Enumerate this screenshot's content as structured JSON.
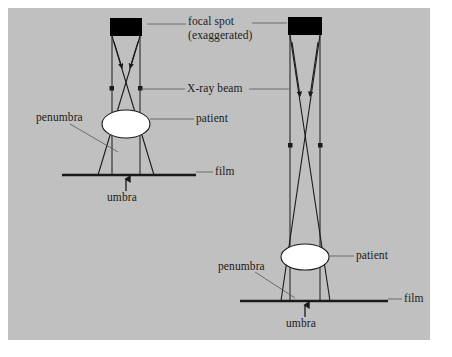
{
  "figure": {
    "background_color": "#c0c0c0",
    "border_color": "#ffffff",
    "line_color": "#1a1a1a",
    "focal_spot_color": "#000000",
    "patient_color": "#ffffff"
  },
  "labels": {
    "focal_spot": "focal spot",
    "focal_spot_note": "(exaggerated)",
    "xray_beam": "X-ray beam",
    "patient_left": "patient",
    "patient_right": "patient",
    "penumbra_left": "penumbra",
    "penumbra_right": "penumbra",
    "film_left": "film",
    "film_right": "film",
    "umbra_left": "umbra",
    "umbra_right": "umbra"
  },
  "diagrams": [
    {
      "name": "short-source-to-film-distance",
      "focal_spot": {
        "x": 110,
        "y": 18,
        "width": 32,
        "height": 18
      },
      "patient": {
        "cx": 126,
        "cy": 124,
        "rx": 24,
        "ry": 14
      },
      "film": {
        "x1": 62,
        "x2": 196,
        "y": 175
      },
      "beam_left_edge_top": 112,
      "beam_right_edge_top": 140,
      "beam_left_edge_bottom": 104,
      "beam_right_edge_bottom": 148,
      "umbra_arrow_x": 126,
      "umbra_arrow_y": 182
    },
    {
      "name": "long-source-to-film-distance",
      "focal_spot": {
        "x": 288,
        "y": 17,
        "width": 34,
        "height": 18
      },
      "patient": {
        "cx": 305,
        "cy": 257,
        "rx": 24,
        "ry": 13
      },
      "film": {
        "x1": 240,
        "x2": 388,
        "y": 301
      },
      "beam_left_edge_top": 290,
      "beam_right_edge_top": 320,
      "beam_left_edge_bottom": 285,
      "beam_right_edge_bottom": 326,
      "umbra_arrow_x": 305,
      "umbra_arrow_y": 308
    }
  ],
  "label_positions": {
    "focal_spot": {
      "left": 188,
      "top": 15
    },
    "focal_spot_note": {
      "left": 188,
      "top": 29
    },
    "xray_beam": {
      "left": 187,
      "top": 83
    },
    "patient_left": {
      "left": 196,
      "top": 112
    },
    "patient_right": {
      "left": 356,
      "top": 251
    },
    "penumbra_left": {
      "left": 36,
      "top": 111
    },
    "penumbra_right": {
      "left": 221,
      "top": 262
    },
    "film_left": {
      "left": 215,
      "top": 166
    },
    "film_right": {
      "left": 404,
      "top": 293
    },
    "umbra_left": {
      "left": 107,
      "top": 188
    },
    "umbra_right": {
      "left": 286,
      "top": 314
    }
  }
}
